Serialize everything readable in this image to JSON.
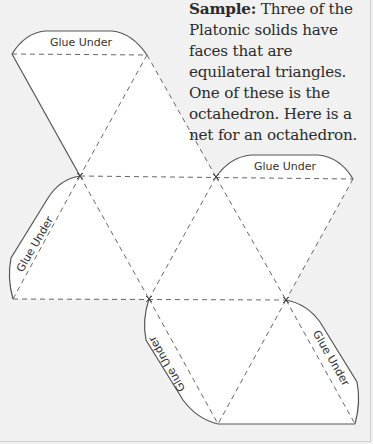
{
  "caption": {
    "label": "Sample:",
    "text": " Three of the Platonic solids have faces that are equilateral triangles. One of these is the octahedron. Here is a net for an octahedron."
  },
  "net": {
    "title": "Octahedron net",
    "faces": 8,
    "tabs": [
      {
        "id": "top",
        "label": "Glue Under"
      },
      {
        "id": "right-top",
        "label": "Glue Under"
      },
      {
        "id": "left",
        "label": "Glue Under"
      },
      {
        "id": "bottom-left",
        "label": "Glue Under"
      },
      {
        "id": "bottom-right",
        "label": "Glue Under"
      }
    ]
  },
  "colors": {
    "background": "#f1f1f1",
    "face_fill": "#ffffff",
    "line": "#555555"
  }
}
